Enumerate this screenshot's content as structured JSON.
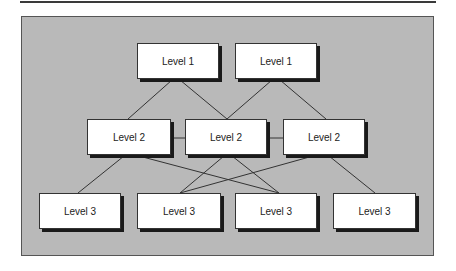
{
  "diagram": {
    "type": "hierarchy",
    "levels": [
      {
        "name": "Level 1",
        "nodes": [
          {
            "id": "l1a",
            "label": "Level 1",
            "x": 137,
            "y": 43
          },
          {
            "id": "l1b",
            "label": "Level 1",
            "x": 235,
            "y": 43
          }
        ]
      },
      {
        "name": "Level 2",
        "nodes": [
          {
            "id": "l2a",
            "label": "Level 2",
            "x": 87,
            "y": 119
          },
          {
            "id": "l2b",
            "label": "Level 2",
            "x": 185,
            "y": 119
          },
          {
            "id": "l2c",
            "label": "Level 2",
            "x": 283,
            "y": 119
          }
        ]
      },
      {
        "name": "Level 3",
        "nodes": [
          {
            "id": "l3a",
            "label": "Level 3",
            "x": 39,
            "y": 193
          },
          {
            "id": "l3b",
            "label": "Level 3",
            "x": 137,
            "y": 193
          },
          {
            "id": "l3c",
            "label": "Level 3",
            "x": 235,
            "y": 193
          },
          {
            "id": "l3d",
            "label": "Level 3",
            "x": 333,
            "y": 193
          }
        ]
      }
    ],
    "edges": [
      [
        "l1a",
        "l2a"
      ],
      [
        "l1a",
        "l2b"
      ],
      [
        "l1b",
        "l2b"
      ],
      [
        "l1b",
        "l2c"
      ],
      [
        "l2a",
        "l2b"
      ],
      [
        "l2b",
        "l2c"
      ],
      [
        "l2a",
        "l3a"
      ],
      [
        "l2a",
        "l3c"
      ],
      [
        "l2b",
        "l3b"
      ],
      [
        "l2b",
        "l3c"
      ],
      [
        "l2c",
        "l3b"
      ],
      [
        "l2c",
        "l3d"
      ]
    ],
    "colors": {
      "panel": "#b9b9b9",
      "node_fill": "#ffffff",
      "node_shadow": "#1a1a1a",
      "edge": "#333333"
    }
  }
}
